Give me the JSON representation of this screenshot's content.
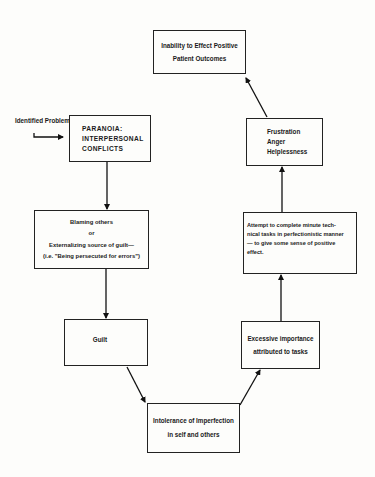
{
  "diagram": {
    "entry_label": [
      "Identified",
      "Problem"
    ],
    "nodes": [
      {
        "id": "outcomes",
        "lines": [
          "Inability to Effect Positive",
          "Patient Outcomes"
        ]
      },
      {
        "id": "paranoia",
        "lines": [
          "PARANOIA:",
          "INTERPERSONAL",
          "CONFLICTS"
        ]
      },
      {
        "id": "blaming",
        "lines": [
          "Blaming others",
          "or",
          "Externalizing source of guilt—",
          "(i.e. \"Being persecuted for errors\")"
        ]
      },
      {
        "id": "guilt",
        "lines": [
          "Guilt"
        ]
      },
      {
        "id": "intolerance",
        "lines": [
          "Intolerance of Imperfection",
          "in self and others"
        ]
      },
      {
        "id": "excessive",
        "lines": [
          "Excessive importance",
          "attributed to tasks"
        ]
      },
      {
        "id": "attempt",
        "lines": [
          "Attempt to complete minute tech-",
          "nical tasks in perfectionistic manner",
          "— to give some sense of positive",
          "effect."
        ]
      },
      {
        "id": "frustration",
        "lines": [
          "Frustration",
          "Anger",
          "Helplessness"
        ]
      }
    ],
    "edges": [
      {
        "from": "identified-problem",
        "to": "paranoia"
      },
      {
        "from": "paranoia",
        "to": "blaming"
      },
      {
        "from": "blaming",
        "to": "guilt"
      },
      {
        "from": "guilt",
        "to": "intolerance"
      },
      {
        "from": "intolerance",
        "to": "excessive"
      },
      {
        "from": "excessive",
        "to": "attempt"
      },
      {
        "from": "attempt",
        "to": "frustration"
      },
      {
        "from": "frustration",
        "to": "outcomes"
      }
    ]
  }
}
